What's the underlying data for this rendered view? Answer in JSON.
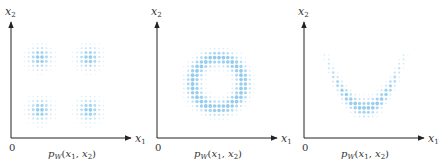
{
  "panels": [
    {
      "id": "four-clusters",
      "x_label": "x",
      "x_sub": "1",
      "y_label": "x",
      "y_sub": "2",
      "origin_label": "0",
      "caption": "p_W(x_1, x_2)",
      "caption_parts": {
        "p": "p",
        "sub": "W",
        "args": "(x",
        "a1": "1",
        "comma": ", x",
        "a2": "2",
        "close": ")"
      },
      "shape": "four gaussian clusters"
    },
    {
      "id": "ring",
      "x_label": "x",
      "x_sub": "1",
      "y_label": "x",
      "y_sub": "2",
      "origin_label": "0",
      "caption": "p_W(x_1, x_2)",
      "caption_parts": {
        "p": "p",
        "sub": "W",
        "args": "(x",
        "a1": "1",
        "comma": ", x",
        "a2": "2",
        "close": ")"
      },
      "shape": "ring"
    },
    {
      "id": "u-shape",
      "x_label": "x",
      "x_sub": "1",
      "y_label": "x",
      "y_sub": "2",
      "origin_label": "0",
      "caption": "p_W(x_1, x_2)",
      "caption_parts": {
        "p": "p",
        "sub": "W",
        "args": "(x",
        "a1": "1",
        "comma": ", x",
        "a2": "2",
        "close": ")"
      },
      "shape": "U / banana"
    }
  ],
  "colors": {
    "axis": "#222222",
    "dot": "#8cc8ec",
    "text": "#333333"
  }
}
